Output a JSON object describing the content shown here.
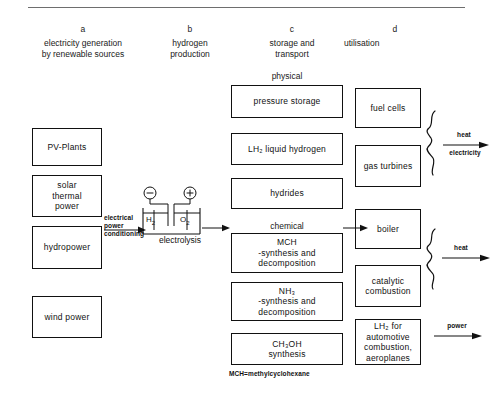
{
  "diagram": {
    "title_rule": true,
    "footnote": "MCH=methylcyclohexane",
    "columns": [
      {
        "letter": "a",
        "caption": "electricity generation\nby renewable sources"
      },
      {
        "letter": "b",
        "caption": "hydrogen\nproduction"
      },
      {
        "letter": "c",
        "caption": "storage and\ntransport"
      },
      {
        "letter": "d",
        "caption": "utilisation"
      }
    ],
    "section_labels": {
      "physical": "physical",
      "chemical": "chemical"
    },
    "column_a_boxes": [
      {
        "label": "PV-Plants"
      },
      {
        "label": "solar\nthermal\npower"
      },
      {
        "label": "hydropower"
      },
      {
        "label": "wind power"
      }
    ],
    "column_b": {
      "arrow_label": "electrical\npower\nconditioning",
      "caption": "electrolysis",
      "cathode_symbol": "⊖",
      "anode_symbol": "⊕",
      "cathode_gas": "H",
      "cathode_gas_sub": "2",
      "anode_gas": "O",
      "anode_gas_sub": "2"
    },
    "column_c_physical_boxes": [
      {
        "label": "pressure storage"
      },
      {
        "label": "LH₂ liquid hydrogen"
      },
      {
        "label": "hydrides"
      }
    ],
    "column_c_chemical_boxes": [
      {
        "label": "MCH\n-synthesis and\ndecomposition"
      },
      {
        "label": "NH₃\n-synthesis and\ndecomposition"
      },
      {
        "label": "CH₃OH\nsynthesis"
      }
    ],
    "column_d_boxes": [
      {
        "label": "fuel cells"
      },
      {
        "label": "gas turbines"
      },
      {
        "label": "boiler"
      },
      {
        "label": "catalytic\ncombustion"
      },
      {
        "label": "LH₂ for\nautomotive\ncombustion,\naeroplanes"
      }
    ],
    "outputs": [
      {
        "name": "heat-electricity",
        "top_label": "heat",
        "bottom_label": "electricity"
      },
      {
        "name": "heat",
        "top_label": "heat",
        "bottom_label": ""
      },
      {
        "name": "power",
        "top_label": "power",
        "bottom_label": ""
      }
    ]
  }
}
